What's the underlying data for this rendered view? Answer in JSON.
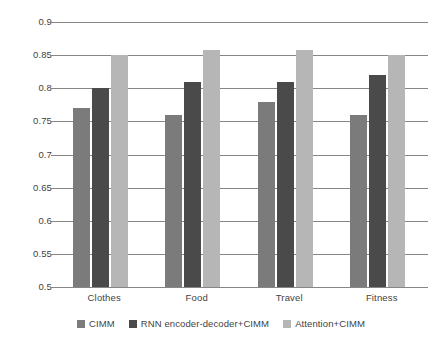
{
  "chart_data": {
    "type": "bar",
    "title": "",
    "subtitle": "",
    "xlabel": "",
    "ylabel": "",
    "categories": [
      "Clothes",
      "Food",
      "Travel",
      "Fitness"
    ],
    "series": [
      {
        "name": "CIMM",
        "color": "#7b7b7b",
        "values": [
          0.77,
          0.76,
          0.78,
          0.76
        ]
      },
      {
        "name": "RNN encoder-decoder+CIMM",
        "color": "#4a4a4a",
        "values": [
          0.8,
          0.81,
          0.81,
          0.82
        ]
      },
      {
        "name": "Attention+CIMM",
        "color": "#b6b6b6",
        "values": [
          0.85,
          0.858,
          0.858,
          0.85
        ]
      }
    ],
    "ylim": [
      0.5,
      0.9
    ],
    "ytick_values": [
      0.5,
      0.55,
      0.6,
      0.65,
      0.7,
      0.75,
      0.8,
      0.85,
      0.9
    ],
    "ytick_labels": [
      "0.5",
      "0.55",
      "0.6",
      "0.65",
      "0.7",
      "0.75",
      "0.8",
      "0.85",
      "0.9"
    ],
    "grid": true,
    "grid_axis": "y",
    "grid_color": "#868686",
    "legend_position": "bottom",
    "background": "#ffffff"
  }
}
